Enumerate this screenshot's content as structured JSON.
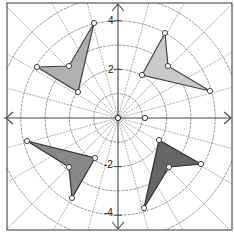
{
  "diagram": {
    "type": "polar-grid-with-polygons",
    "center_px": [
      118,
      118
    ],
    "unit_px": 24.3,
    "frame": {
      "x": 7,
      "y": 3,
      "width": 225,
      "height": 227,
      "stroke": "#555555"
    },
    "circles_radius_units": [
      1,
      2,
      3,
      4,
      5
    ],
    "radial_lines_deg_step": 15,
    "axes": {
      "color": "#444444",
      "labels": [
        {
          "text": "4",
          "x": 108,
          "y": 24
        },
        {
          "text": "2",
          "x": 108,
          "y": 73
        },
        {
          "text": "-2",
          "x": 104,
          "y": 168
        },
        {
          "text": "-4",
          "x": 104,
          "y": 216
        }
      ]
    },
    "center_point": [
      118,
      118
    ],
    "extra_point": [
      145,
      118
    ],
    "polygons": [
      {
        "name": "top-left-kite",
        "fill": "#a6a6a6",
        "stroke": "#444444",
        "points": [
          [
            94,
            23
          ],
          [
            69,
            66
          ],
          [
            37,
            67
          ],
          [
            78,
            92
          ]
        ]
      },
      {
        "name": "top-right-kite",
        "fill": "#c4c4c4",
        "stroke": "#444444",
        "points": [
          [
            165,
            33
          ],
          [
            168,
            66
          ],
          [
            210,
            91
          ],
          [
            142,
            75
          ]
        ]
      },
      {
        "name": "bottom-left-kite",
        "fill": "#7a7a7a",
        "stroke": "#333333",
        "points": [
          [
            27,
            141
          ],
          [
            95,
            158
          ],
          [
            72,
            198
          ],
          [
            69,
            167
          ]
        ]
      },
      {
        "name": "bottom-right-kite",
        "fill": "#555555",
        "stroke": "#333333",
        "points": [
          [
            159,
            140
          ],
          [
            201,
            164
          ],
          [
            169,
            167
          ],
          [
            144,
            208
          ]
        ]
      }
    ]
  }
}
